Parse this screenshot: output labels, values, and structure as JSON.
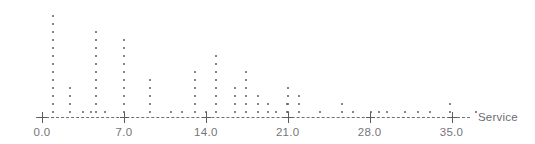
{
  "chart_data": {
    "type": "dotplot",
    "title": "",
    "subtitle": "",
    "xlabel": "Service",
    "ylabel": "",
    "grid": false,
    "legend": null,
    "xlim": [
      -0.4,
      37.0
    ],
    "xticks": [
      0.0,
      7.0,
      14.0,
      21.0,
      28.0,
      35.0
    ],
    "xticklabels": [
      "0.0",
      "7.0",
      "14.0",
      "21.0",
      "28.0",
      "35.0"
    ],
    "dot_color": "#5c5c64",
    "axis_color": "#6f6f77",
    "tick_label_color": "#757579",
    "stacks": [
      {
        "x": 0.9,
        "count": 13
      },
      {
        "x": 2.4,
        "count": 4
      },
      {
        "x": 3.5,
        "count": 1
      },
      {
        "x": 4.2,
        "count": 1
      },
      {
        "x": 4.6,
        "count": 11
      },
      {
        "x": 5.4,
        "count": 1
      },
      {
        "x": 7.0,
        "count": 10
      },
      {
        "x": 9.2,
        "count": 5
      },
      {
        "x": 11.0,
        "count": 1
      },
      {
        "x": 12.0,
        "count": 1
      },
      {
        "x": 13.1,
        "count": 6
      },
      {
        "x": 14.0,
        "count": 1
      },
      {
        "x": 14.9,
        "count": 8
      },
      {
        "x": 16.5,
        "count": 4
      },
      {
        "x": 17.4,
        "count": 6
      },
      {
        "x": 18.5,
        "count": 3
      },
      {
        "x": 19.3,
        "count": 2
      },
      {
        "x": 20.0,
        "count": 1
      },
      {
        "x": 20.9,
        "count": 2
      },
      {
        "x": 21.0,
        "count": 4
      },
      {
        "x": 22.0,
        "count": 3
      },
      {
        "x": 23.8,
        "count": 1
      },
      {
        "x": 25.6,
        "count": 2
      },
      {
        "x": 26.6,
        "count": 1
      },
      {
        "x": 28.1,
        "count": 1
      },
      {
        "x": 28.8,
        "count": 1
      },
      {
        "x": 29.5,
        "count": 1
      },
      {
        "x": 31.0,
        "count": 1
      },
      {
        "x": 32.1,
        "count": 1
      },
      {
        "x": 33.2,
        "count": 1
      },
      {
        "x": 34.9,
        "count": 2
      },
      {
        "x": 37.1,
        "count": 1
      }
    ]
  },
  "axis": {
    "title": "Service",
    "ticks": [
      {
        "value": 0.0,
        "label": "0.0"
      },
      {
        "value": 7.0,
        "label": "7.0"
      },
      {
        "value": 14.0,
        "label": "14.0"
      },
      {
        "value": 21.0,
        "label": "21.0"
      },
      {
        "value": 28.0,
        "label": "28.0"
      },
      {
        "value": 35.0,
        "label": "35.0"
      }
    ]
  }
}
